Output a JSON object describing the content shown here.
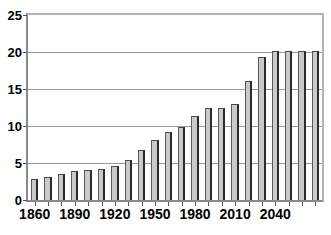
{
  "chart_data": {
    "type": "bar",
    "title": "",
    "subtitle": "",
    "xlabel": "",
    "ylabel": "",
    "xlim": [
      1855,
      2075
    ],
    "ylim": [
      0,
      25
    ],
    "grid": true,
    "legend": null,
    "y_ticks": [
      0,
      5,
      10,
      15,
      20,
      25
    ],
    "y_tick_labels": [
      "0",
      "5",
      "10",
      "15",
      "20",
      "25"
    ],
    "x_tick_labels": [
      "1860",
      "1890",
      "1920",
      "1950",
      "1980",
      "2010",
      "2040"
    ],
    "x_tick_values": [
      1860,
      1890,
      1920,
      1950,
      1980,
      2010,
      2040
    ],
    "categories": [
      1860,
      1870,
      1880,
      1890,
      1900,
      1910,
      1920,
      1930,
      1940,
      1950,
      1960,
      1970,
      1980,
      1990,
      2000,
      2010,
      2020,
      2030,
      2040,
      2050,
      2060,
      2070
    ],
    "values": [
      2.8,
      3.1,
      3.5,
      3.9,
      4.1,
      4.2,
      4.6,
      5.4,
      6.8,
      8.1,
      9.2,
      9.8,
      11.3,
      12.5,
      12.4,
      13.0,
      16.1,
      19.3,
      20.1,
      20.2,
      20.2,
      20.2
    ],
    "bar_fill_color": "#c9c9c9",
    "bar_edge_color": "#2b2b2b",
    "grid_color": "#9a9a9a",
    "axis_color": "#8a8a8a",
    "background_color": "#ffffff"
  }
}
